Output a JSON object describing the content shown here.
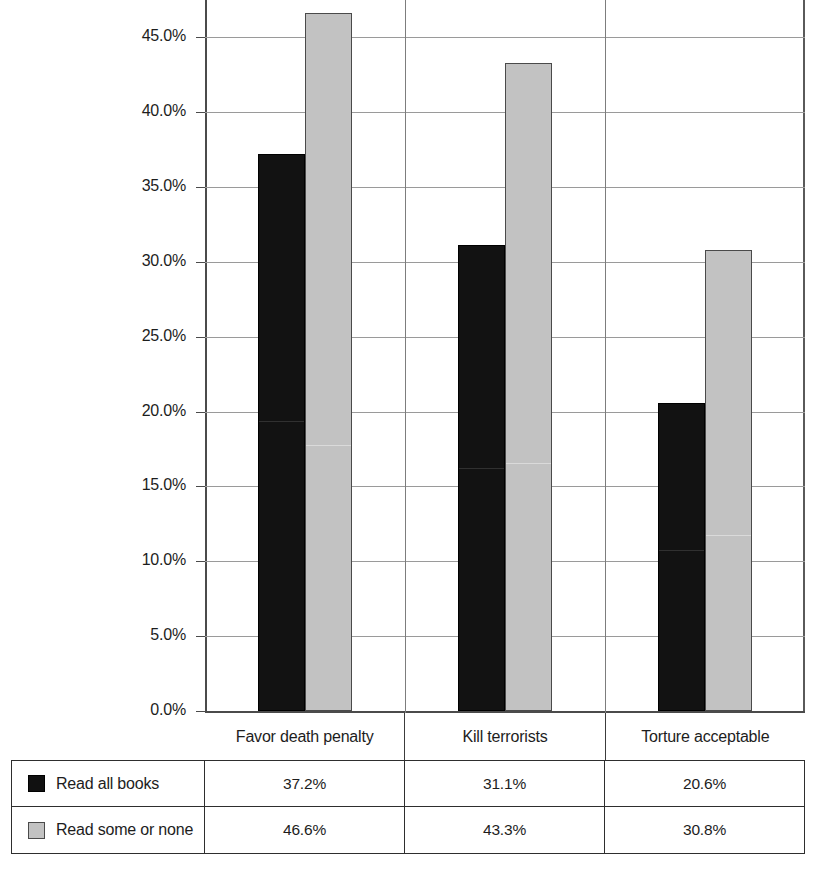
{
  "chart_data": {
    "type": "bar",
    "title": "",
    "subtitle": "",
    "xlabel": "",
    "ylabel": "",
    "categories": [
      "Favor death penalty",
      "Kill terrorists",
      "Torture acceptable"
    ],
    "series": [
      {
        "name": "Read all books",
        "values": [
          37.2,
          31.1,
          20.6
        ],
        "color": "#111111"
      },
      {
        "name": "Read some or none",
        "values": [
          46.6,
          43.3,
          30.8
        ],
        "color": "#c2c2c2"
      }
    ],
    "value_labels": [
      [
        "37.2%",
        "31.1%",
        "20.6%"
      ],
      [
        "46.6%",
        "43.3%",
        "30.8%"
      ]
    ],
    "ylim": [
      0,
      47.5
    ],
    "ytick_values": [
      0,
      5,
      10,
      15,
      20,
      25,
      30,
      35,
      40,
      45
    ],
    "ytick_labels": [
      "0.0%",
      "5.0%",
      "10.0%",
      "15.0%",
      "20.0%",
      "25.0%",
      "30.0%",
      "35.0%",
      "40.0%",
      "45.0%"
    ],
    "grid": true,
    "grid_axis": "y",
    "legend_position": "bottom-table",
    "orientation": "vertical"
  },
  "table": {
    "rows": [
      {
        "swatch": "dark-square-swatch",
        "label": "Read all books",
        "values": [
          "37.2%",
          "31.1%",
          "20.6%"
        ]
      },
      {
        "swatch": "light-square-swatch",
        "label": "Read some or none",
        "values": [
          "46.6%",
          "43.3%",
          "30.8%"
        ]
      }
    ]
  },
  "colors": {
    "series_dark": "#111111",
    "series_light": "#c2c2c2",
    "gridline": "#9a9a9a",
    "axis": "#4b4b4b",
    "text": "#1d1d1d",
    "background": "#ffffff"
  }
}
